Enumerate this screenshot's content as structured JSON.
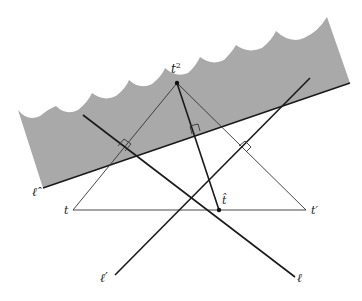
{
  "diagram": {
    "labels": {
      "t_squared": "t",
      "t_squared_sup": "2",
      "t": "t",
      "t_prime": "t′",
      "t_hat": "t̂",
      "ell_hat": "ℓ̂",
      "ell": "ℓ",
      "ell_prime": "ℓ′"
    },
    "colors": {
      "region_fill": "#a9a9a9",
      "line": "#1a1a1a",
      "thin_line": "#333333",
      "background": "#ffffff"
    },
    "points": {
      "t_squared": [
        177,
        83
      ],
      "t": [
        73,
        210
      ],
      "t_prime": [
        306,
        210
      ],
      "t_hat": [
        219,
        210
      ]
    }
  }
}
